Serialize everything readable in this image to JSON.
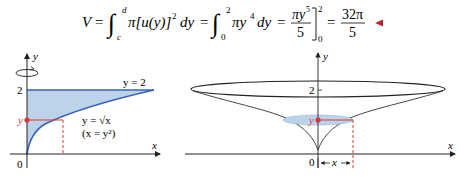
{
  "equation": {
    "lhs": "V",
    "eq": "=",
    "int1": {
      "lower": "c",
      "upper": "d",
      "integrand": "π[u(y)]",
      "power": "2",
      "diff": "dy"
    },
    "int2": {
      "lower": "0",
      "upper": "2",
      "integrand": "πy",
      "power": "4",
      "diff": "dy"
    },
    "frac1": {
      "num": "πy",
      "num_power": "5",
      "den": "5",
      "eval_lower": "0",
      "eval_upper": "2"
    },
    "result": {
      "num": "32π",
      "den": "5"
    },
    "end_marker_color": "#b5272d"
  },
  "left_figure": {
    "y_axis_label": "y",
    "x_axis_label": "x",
    "origin_label": "0",
    "tick_2_label": "2",
    "line_label": "y = 2",
    "curve_label": "y = √x",
    "curve_label_alt": "(x = y²)",
    "point_label": "y",
    "rotation_icon": "rotate-about-y-axis",
    "fill_color": "#bcd3ea",
    "curve_color": "#3a63b8",
    "highlight_color": "#d23a3a"
  },
  "right_figure": {
    "y_axis_label": "y",
    "x_axis_label": "x",
    "origin_label": "0",
    "tick_2_label": "2",
    "point_label": "y",
    "radius_label": "x",
    "disk_color": "#bcd3ea",
    "highlight_color": "#d23a3a"
  }
}
